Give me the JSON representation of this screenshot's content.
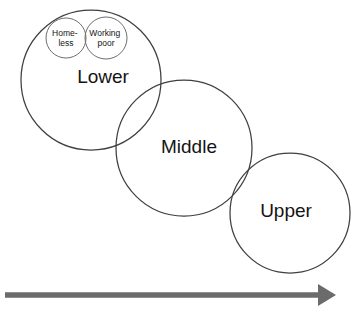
{
  "diagram": {
    "background_color": "#ffffff",
    "circle_stroke_color": "#3f3f3f",
    "subcircle_stroke_color": "#6e6e6e",
    "arrow_color": "#6b6b6b",
    "text_color": "#141414",
    "classes": [
      {
        "id": "lower",
        "label": "Lower",
        "cx": 91,
        "cy": 80,
        "r": 70,
        "label_x": 103,
        "label_y": 78
      },
      {
        "id": "middle",
        "label": "Middle",
        "cx": 184,
        "cy": 148,
        "r": 68,
        "label_x": 189,
        "label_y": 148
      },
      {
        "id": "upper",
        "label": "Upper",
        "cx": 290,
        "cy": 213,
        "r": 60,
        "label_x": 286,
        "label_y": 212
      }
    ],
    "subgroups": [
      {
        "id": "homeless",
        "line1": "Home-",
        "line2": "less",
        "cx": 66,
        "cy": 38,
        "r": 20,
        "label_x": 66,
        "label_y": 36
      },
      {
        "id": "working-poor",
        "line1": "Working",
        "line2": "poor",
        "cx": 106,
        "cy": 38,
        "r": 21,
        "label_x": 106,
        "label_y": 36
      }
    ],
    "axis_arrow": {
      "id": "status-axis",
      "x_start": 5,
      "x_end": 318,
      "y": 295,
      "tip_x": 336,
      "head_half_height": 11,
      "head_length": 18
    }
  }
}
